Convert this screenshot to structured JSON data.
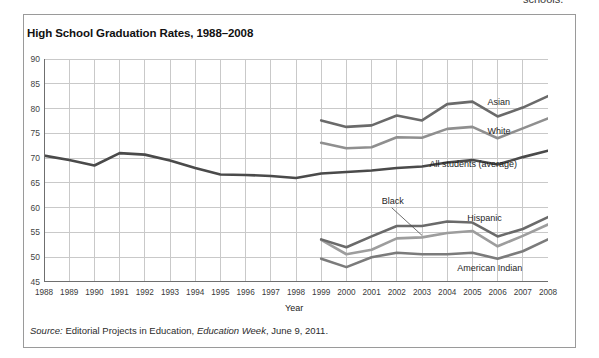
{
  "page": {
    "cut_off_text_above": "schools."
  },
  "figure": {
    "title": "High School Graduation Rates, 1988–2008",
    "source_prefix": "Source:",
    "source_text_1": " Editorial Projects in Education, ",
    "source_italic": "Education Week",
    "source_text_2": ", June 9, 2011."
  },
  "chart_data": {
    "type": "line",
    "title": "High School Graduation Rates, 1988–2008",
    "xlabel": "Year",
    "ylabel": "",
    "grid": true,
    "legend_position": "inline-right-labels",
    "x": [
      1988,
      1989,
      1990,
      1991,
      1992,
      1993,
      1994,
      1995,
      1996,
      1997,
      1998,
      1999,
      2000,
      2001,
      2002,
      2003,
      2004,
      2005,
      2006,
      2007,
      2008
    ],
    "xlim": [
      1988,
      2008
    ],
    "ylim": [
      45,
      90
    ],
    "ytick_labels": [
      "45",
      "50",
      "55",
      "60",
      "65",
      "70",
      "75",
      "80",
      "85",
      "90"
    ],
    "xtick_labels": [
      "1988",
      "1989",
      "1990",
      "1991",
      "1992",
      "1993",
      "1994",
      "1995",
      "1996",
      "1997",
      "1998",
      "1999",
      "2000",
      "2001",
      "2002",
      "2003",
      "2004",
      "2005",
      "2006",
      "2007",
      "2008"
    ],
    "series": [
      {
        "name": "Asian",
        "color": "#6a6a6a",
        "label_x": 2005.6,
        "label_y": 81.2,
        "x": [
          1999,
          2000,
          2001,
          2002,
          2003,
          2004,
          2005,
          2006,
          2007,
          2008
        ],
        "values": [
          77.6,
          76.3,
          76.6,
          78.6,
          77.6,
          80.9,
          81.4,
          78.4,
          80.2,
          82.5
        ]
      },
      {
        "name": "White",
        "color": "#8f8f8f",
        "label_x": 2005.6,
        "label_y": 75.3,
        "x": [
          1999,
          2000,
          2001,
          2002,
          2003,
          2004,
          2005,
          2006,
          2007,
          2008
        ],
        "values": [
          73.1,
          72.0,
          72.2,
          74.2,
          74.1,
          75.9,
          76.3,
          74.0,
          76.0,
          78.0
        ]
      },
      {
        "name": "All students (average)",
        "color": "#4a4a4a",
        "label_x": 2003.3,
        "label_y": 68.6,
        "x": [
          1988,
          1989,
          1990,
          1991,
          1992,
          1993,
          1994,
          1995,
          1996,
          1997,
          1998,
          1999,
          2000,
          2001,
          2002,
          2003,
          2004,
          2005,
          2006,
          2007,
          2008
        ],
        "values": [
          70.5,
          69.6,
          68.5,
          71.0,
          70.7,
          69.5,
          68.0,
          66.7,
          66.6,
          66.4,
          66.0,
          66.9,
          67.2,
          67.5,
          68.0,
          68.3,
          69.1,
          69.6,
          68.7,
          70.2,
          71.5
        ]
      },
      {
        "name": "Black",
        "color": "#9d9d9d",
        "label_x": 2001.4,
        "label_y": 61.2,
        "label_leader": true,
        "x": [
          1999,
          2000,
          2001,
          2002,
          2003,
          2004,
          2005,
          2006,
          2007,
          2008
        ],
        "values": [
          53.5,
          50.6,
          51.5,
          53.8,
          54.0,
          54.9,
          55.3,
          52.2,
          54.3,
          56.6
        ]
      },
      {
        "name": "Hispanic",
        "color": "#6a6a6a",
        "label_x": 2004.8,
        "label_y": 57.7,
        "x": [
          1999,
          2000,
          2001,
          2002,
          2003,
          2004,
          2005,
          2006,
          2007,
          2008
        ],
        "values": [
          53.6,
          52.0,
          54.2,
          56.3,
          56.3,
          57.2,
          57.0,
          54.2,
          55.7,
          58.1
        ]
      },
      {
        "name": "American Indian",
        "color": "#7b7b7b",
        "label_x": 2004.4,
        "label_y": 47.6,
        "x": [
          1999,
          2000,
          2001,
          2002,
          2003,
          2004,
          2005,
          2006,
          2007,
          2008
        ],
        "values": [
          49.7,
          48.0,
          50.0,
          50.9,
          50.6,
          50.6,
          50.9,
          49.7,
          51.2,
          53.6
        ]
      }
    ]
  }
}
